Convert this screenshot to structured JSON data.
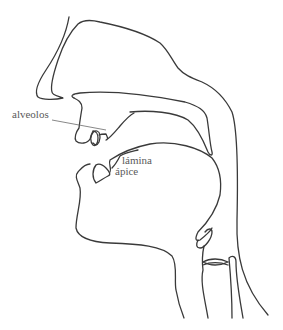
{
  "figure": {
    "line_color": "#3a3a3a",
    "label_color": "#5a5a5a",
    "labels": {
      "alveolos": "alveolos",
      "lamina": "lámina",
      "apice": "ápice"
    }
  }
}
